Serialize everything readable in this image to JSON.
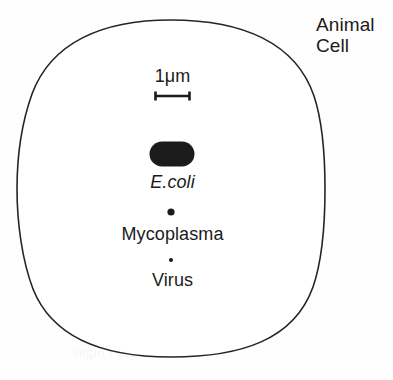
{
  "figure": {
    "kind": "scale-comparison-diagram",
    "background_color": "#fefefe",
    "ink_color": "#1b1b1b",
    "outline_color": "#252525"
  },
  "cell": {
    "label_line1": "Animal",
    "label_line2": "Cell",
    "shape": "rounded-superellipse",
    "stroke_width_px": 1.6,
    "bounds": {
      "x": 17,
      "y": 20,
      "width": 308,
      "height": 337
    }
  },
  "scale_bar": {
    "label": "1μm",
    "bar_x_start": 155,
    "bar_x_end": 190,
    "bar_y": 96,
    "cap_height_px": 9,
    "stroke_width_px": 2.4
  },
  "organisms": [
    {
      "name": "E.coli",
      "label": "E.coli",
      "italic": true,
      "glyph": "capsule",
      "fill": "#1b1b1b",
      "cx": 172,
      "cy": 154,
      "width": 45,
      "height": 25
    },
    {
      "name": "Mycoplasma",
      "label": "Mycoplasma",
      "italic": false,
      "glyph": "dot",
      "fill": "#1b1b1b",
      "cx": 171,
      "cy": 212,
      "diameter": 7
    },
    {
      "name": "Virus",
      "label": "Virus",
      "italic": false,
      "glyph": "dot",
      "fill": "#1b1b1b",
      "cx": 171,
      "cy": 260,
      "diameter": 4
    }
  ],
  "artifacts": [
    {
      "text": "apenas",
      "x": 186,
      "y": 292,
      "size": 15
    },
    {
      "text": "o maior",
      "x": 58,
      "y": 300,
      "size": 15
    },
    {
      "text": "copia imperial",
      "x": 112,
      "y": 322,
      "size": 15
    },
    {
      "text": "regio i gigante",
      "x": 74,
      "y": 344,
      "size": 15
    },
    {
      "text": "nucleo",
      "x": 232,
      "y": 212,
      "size": 14
    }
  ]
}
